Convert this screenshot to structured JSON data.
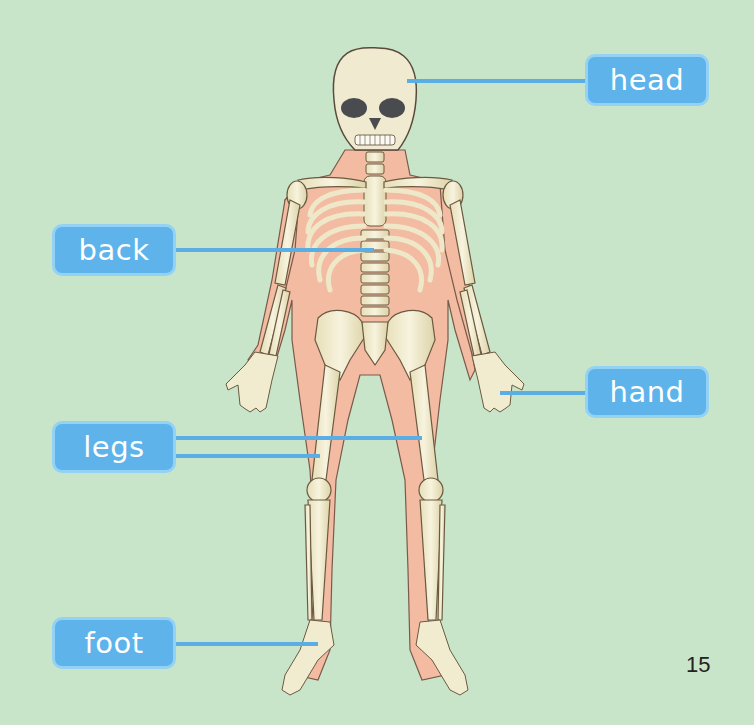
{
  "diagram": {
    "labels": [
      {
        "id": "head",
        "text": "head"
      },
      {
        "id": "back",
        "text": "back"
      },
      {
        "id": "hand",
        "text": "hand"
      },
      {
        "id": "legs",
        "text": "legs"
      },
      {
        "id": "foot",
        "text": "foot"
      }
    ]
  },
  "page": {
    "number": "15"
  },
  "colors": {
    "background": "#c8e5ca",
    "label_fill": "#5db3ea",
    "label_border": "#94d2f5",
    "leader_line": "#5aaee4",
    "skin": "#f2b9a0",
    "bone": "#f1ecd0",
    "outline": "#5a4a3a"
  }
}
